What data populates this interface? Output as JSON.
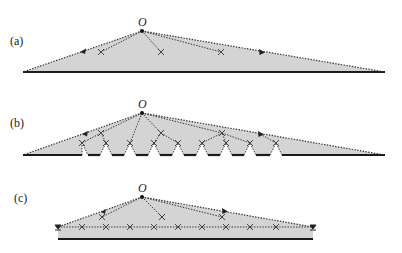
{
  "figure": {
    "colors": {
      "shade": "#d4d4d4",
      "base_line": "#1a1a1a",
      "dotted": "#333333",
      "cross": "#444444"
    },
    "panels": [
      {
        "label": "(a)",
        "origin_label": "O",
        "description": "Triangle from origin O to long base; dotted rays with arrows, three crosses"
      },
      {
        "label": "(b)",
        "origin_label": "O",
        "description": "Same triangle with notched base; upper and lower rows of crosses"
      },
      {
        "label": "(c)",
        "origin_label": "O",
        "description": "Shorter triangle with horizontal dotted line of crosses and end markers"
      }
    ]
  }
}
